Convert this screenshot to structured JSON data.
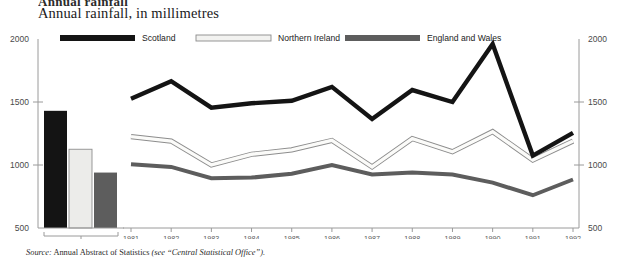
{
  "heading": "Annual rainfall",
  "subtitle": "Annual rainfall, in millimetres",
  "source": {
    "prefix": "Source:",
    "text": "Annual Abstract of Statistics",
    "paren_open": "(see “",
    "paren_text": "Central Statistical Office",
    "paren_close": "”)."
  },
  "legend": [
    {
      "label": "Scotland",
      "color": "#141414"
    },
    {
      "label": "Northern Ireland",
      "color": "#f2f2f0"
    },
    {
      "label": "England and Wales",
      "color": "#5d5d5d"
    }
  ],
  "chart_data": {
    "type": "line",
    "title": "Annual rainfall, in millimetres",
    "xlabel": "",
    "ylabel": "millimetres",
    "ylim": [
      500,
      2000
    ],
    "yticks": [
      500,
      1000,
      1500,
      2000
    ],
    "grid": false,
    "legend_position": "top",
    "baseline_panel": {
      "type": "bar",
      "category": "1951—1980",
      "categories": [
        "Scotland",
        "Northern Ireland",
        "England and Wales"
      ],
      "values": [
        1430,
        1125,
        940
      ],
      "colors": [
        "#141414",
        "#ececea",
        "#5d5d5d"
      ]
    },
    "x": [
      1981,
      1982,
      1983,
      1984,
      1985,
      1986,
      1987,
      1988,
      1989,
      1990,
      1991,
      1992
    ],
    "series": [
      {
        "name": "Scotland",
        "color": "#141414",
        "values": [
          1525,
          1665,
          1455,
          1490,
          1510,
          1620,
          1365,
          1595,
          1500,
          1960,
          1075,
          1255
        ]
      },
      {
        "name": "Northern Ireland",
        "color": "#fbfbf9",
        "values": [
          1225,
          1190,
          1000,
          1085,
          1120,
          1195,
          985,
          1210,
          1105,
          1265,
          1040,
          1190
        ]
      },
      {
        "name": "England and Wales",
        "color": "#5d5d5d",
        "values": [
          1005,
          985,
          895,
          900,
          930,
          1000,
          925,
          940,
          925,
          860,
          760,
          885
        ]
      }
    ]
  }
}
